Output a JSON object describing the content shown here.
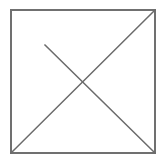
{
  "figure": {
    "title": "Square with crossed diagonals",
    "canvas": {
      "width": 163,
      "height": 162,
      "background_color": "#ffffff"
    },
    "style": {
      "stroke_color": "#707070",
      "diagonal_stroke_color": "#6b6b6b",
      "stroke_width": 1.6,
      "diagonal_stroke_width": 1.5,
      "fill_color": "none"
    },
    "shapes": [
      {
        "name": "square-outline",
        "type": "rect",
        "x": 11,
        "y": 10,
        "width": 144,
        "height": 143,
        "stroke": "#707070",
        "fill": "none"
      },
      {
        "name": "diagonal-bottom-left-to-top-right",
        "type": "line",
        "x1": 11,
        "y1": 153,
        "x2": 155,
        "y2": 10,
        "stroke": "#6b6b6b"
      },
      {
        "name": "diagonal-partial-to-bottom-right",
        "type": "line",
        "x1": 45,
        "y1": 45,
        "x2": 155,
        "y2": 153,
        "stroke": "#6b6b6b"
      }
    ],
    "intersection": {
      "label": "crossing-point",
      "x": 83,
      "y": 83
    }
  }
}
